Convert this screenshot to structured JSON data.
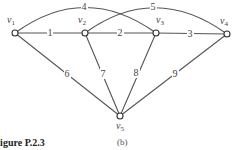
{
  "figure": {
    "caption": "Figure P.2.3",
    "sublabel": "(b)"
  },
  "nodes": [
    {
      "id": "v1",
      "name": "v",
      "sub": "1",
      "x": 15,
      "y": 33
    },
    {
      "id": "v2",
      "name": "v",
      "sub": "2",
      "x": 85,
      "y": 33
    },
    {
      "id": "v3",
      "name": "v",
      "sub": "3",
      "x": 156,
      "y": 33
    },
    {
      "id": "v4",
      "name": "v",
      "sub": "4",
      "x": 227,
      "y": 34
    },
    {
      "id": "v5",
      "name": "v",
      "sub": "5",
      "x": 120,
      "y": 116
    }
  ],
  "edges": [
    {
      "from": "v1",
      "to": "v2",
      "weight": "1"
    },
    {
      "from": "v2",
      "to": "v3",
      "weight": "2"
    },
    {
      "from": "v3",
      "to": "v4",
      "weight": "3"
    },
    {
      "from": "v1",
      "to": "v3",
      "weight": "4",
      "curved": true
    },
    {
      "from": "v2",
      "to": "v4",
      "weight": "5",
      "curved": true
    },
    {
      "from": "v1",
      "to": "v5",
      "weight": "6"
    },
    {
      "from": "v2",
      "to": "v5",
      "weight": "7"
    },
    {
      "from": "v3",
      "to": "v5",
      "weight": "8"
    },
    {
      "from": "v4",
      "to": "v5",
      "weight": "9"
    }
  ]
}
